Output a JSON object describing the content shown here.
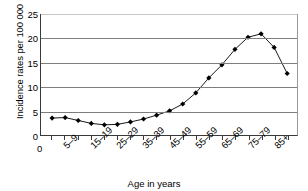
{
  "chart_data": {
    "type": "line",
    "title": "",
    "xlabel": "Age in years",
    "ylabel": "Incidence rates per 100 000",
    "ylim": [
      0,
      25
    ],
    "yticks": [
      0,
      5,
      10,
      15,
      20,
      25
    ],
    "grid": true,
    "legend": null,
    "origin_label": "0",
    "categories": [
      "0–4",
      "5–9",
      "10–14",
      "15–19",
      "20–24",
      "25–29",
      "30–34",
      "35–39",
      "40–44",
      "45–49",
      "50–54",
      "55–59",
      "60–64",
      "65–69",
      "70–74",
      "75–79",
      "80–84",
      "85+"
    ],
    "visible_tick_labels": [
      "5–9",
      "15–19",
      "25–29",
      "35–39",
      "45–49",
      "55–59",
      "65–69",
      "75–79",
      "85+"
    ],
    "values": [
      3.5,
      3.6,
      3.0,
      2.4,
      2.1,
      2.2,
      2.7,
      3.3,
      4.1,
      5.0,
      6.4,
      8.7,
      11.8,
      14.5,
      17.7,
      20.2,
      20.9,
      18.1
    ],
    "extra_point": {
      "label": "",
      "value": 12.7
    },
    "marker": "filled-diamond",
    "line_color": "#1a1a1a",
    "marker_color": "#000000",
    "grid_color": "#7d7d7d"
  }
}
